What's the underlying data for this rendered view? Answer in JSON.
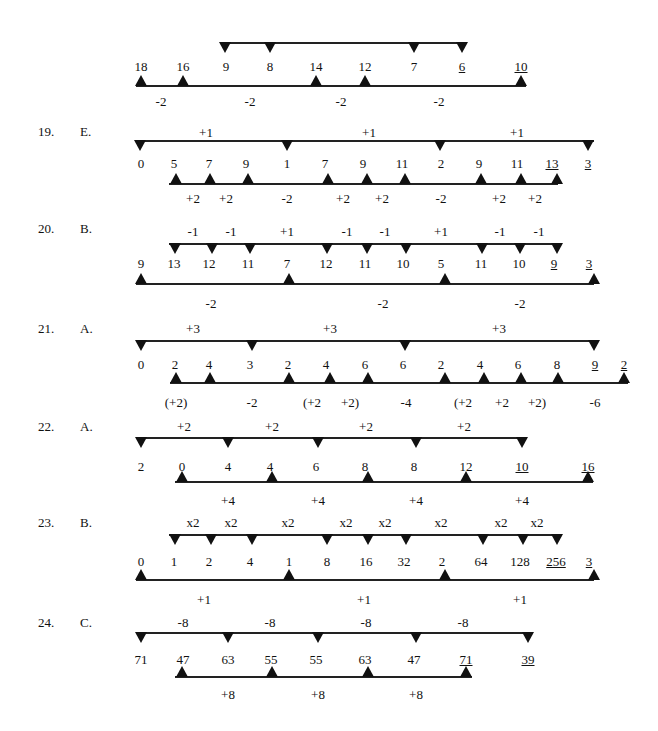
{
  "problems": [
    {
      "id": "18-cont",
      "number": "",
      "answer": "",
      "numY": 60,
      "numbers": [
        {
          "v": "18",
          "x": 141
        },
        {
          "v": "16",
          "x": 183
        },
        {
          "v": "9",
          "x": 226
        },
        {
          "v": "8",
          "x": 270
        },
        {
          "v": "14",
          "x": 316
        },
        {
          "v": "12",
          "x": 365
        },
        {
          "v": "7",
          "x": 414
        },
        {
          "v": "6",
          "x": 462,
          "u": true
        },
        {
          "v": "10",
          "x": 521,
          "u": true
        }
      ],
      "top": {
        "lineY": 42,
        "x1": 225,
        "x2": 463,
        "markers": [
          225,
          270,
          414,
          462
        ],
        "labels": []
      },
      "bottom": {
        "lineY": 85,
        "x1": 136,
        "x2": 526,
        "markers": [
          141,
          183,
          316,
          365,
          521
        ],
        "labels": [
          {
            "v": "-2",
            "x": 161
          },
          {
            "v": "-2",
            "x": 250
          },
          {
            "v": "-2",
            "x": 341
          },
          {
            "v": "-2",
            "x": 439
          }
        ],
        "labelY": 95
      }
    },
    {
      "id": "19",
      "number": "19.",
      "answer": "E.",
      "headY": 125,
      "numY": 157,
      "numbers": [
        {
          "v": "0",
          "x": 141
        },
        {
          "v": "5",
          "x": 174
        },
        {
          "v": "7",
          "x": 209
        },
        {
          "v": "9",
          "x": 246
        },
        {
          "v": "1",
          "x": 287
        },
        {
          "v": "7",
          "x": 325
        },
        {
          "v": "9",
          "x": 363
        },
        {
          "v": "11",
          "x": 402
        },
        {
          "v": "2",
          "x": 441
        },
        {
          "v": "9",
          "x": 479
        },
        {
          "v": "11",
          "x": 517
        },
        {
          "v": "13",
          "x": 552,
          "u": true
        },
        {
          "v": "3",
          "x": 588,
          "u": true
        }
      ],
      "top": {
        "lineY": 140,
        "x1": 136,
        "x2": 594,
        "markers": [
          140,
          287,
          440,
          588
        ],
        "labels": [
          {
            "v": "+1",
            "x": 206
          },
          {
            "v": "+1",
            "x": 369
          },
          {
            "v": "+1",
            "x": 517
          }
        ],
        "labelY": 126
      },
      "bottom": {
        "lineY": 183,
        "x1": 169,
        "x2": 558,
        "markers": [
          176,
          210,
          248,
          328,
          367,
          405,
          481,
          521,
          557
        ],
        "labels": [
          {
            "v": "+2",
            "x": 193
          },
          {
            "v": "+2",
            "x": 226
          },
          {
            "v": "-2",
            "x": 287
          },
          {
            "v": "+2",
            "x": 343
          },
          {
            "v": "+2",
            "x": 382
          },
          {
            "v": "-2",
            "x": 441
          },
          {
            "v": "+2",
            "x": 499
          },
          {
            "v": "+2",
            "x": 535
          }
        ],
        "labelY": 192
      }
    },
    {
      "id": "20",
      "number": "20.",
      "answer": "B.",
      "headY": 222,
      "numY": 257,
      "numbers": [
        {
          "v": "9",
          "x": 141
        },
        {
          "v": "13",
          "x": 174
        },
        {
          "v": "12",
          "x": 209
        },
        {
          "v": "11",
          "x": 248
        },
        {
          "v": "7",
          "x": 287
        },
        {
          "v": "12",
          "x": 326
        },
        {
          "v": "11",
          "x": 365
        },
        {
          "v": "10",
          "x": 403
        },
        {
          "v": "5",
          "x": 441
        },
        {
          "v": "11",
          "x": 481
        },
        {
          "v": "10",
          "x": 519
        },
        {
          "v": "9",
          "x": 554,
          "u": true
        },
        {
          "v": "3",
          "x": 589,
          "u": true
        }
      ],
      "top": {
        "lineY": 243,
        "x1": 169,
        "x2": 559,
        "markers": [
          175,
          212,
          250,
          327,
          367,
          406,
          482,
          520,
          557
        ],
        "labels": [
          {
            "v": "-1",
            "x": 193
          },
          {
            "v": "-1",
            "x": 231
          },
          {
            "v": "+1",
            "x": 287
          },
          {
            "v": "-1",
            "x": 347
          },
          {
            "v": "-1",
            "x": 385
          },
          {
            "v": "+1",
            "x": 441
          },
          {
            "v": "-1",
            "x": 500
          },
          {
            "v": "-1",
            "x": 539
          }
        ],
        "labelY": 225
      },
      "bottom": {
        "lineY": 283,
        "x1": 136,
        "x2": 594,
        "markers": [
          141,
          289,
          445,
          594
        ],
        "labels": [
          {
            "v": "-2",
            "x": 211
          },
          {
            "v": "-2",
            "x": 383
          },
          {
            "v": "-2",
            "x": 520
          }
        ],
        "labelY": 297
      }
    },
    {
      "id": "21",
      "number": "21.",
      "answer": "A.",
      "headY": 322,
      "numY": 358,
      "numbers": [
        {
          "v": "0",
          "x": 141
        },
        {
          "v": "2",
          "x": 175
        },
        {
          "v": "4",
          "x": 209
        },
        {
          "v": "3",
          "x": 250
        },
        {
          "v": "2",
          "x": 288
        },
        {
          "v": "4",
          "x": 326
        },
        {
          "v": "6",
          "x": 365
        },
        {
          "v": "6",
          "x": 403
        },
        {
          "v": "2",
          "x": 441
        },
        {
          "v": "4",
          "x": 480
        },
        {
          "v": "6",
          "x": 518
        },
        {
          "v": "8",
          "x": 557
        },
        {
          "v": "9",
          "x": 595,
          "u": true
        },
        {
          "v": "2",
          "x": 624,
          "u": true
        }
      ],
      "top": {
        "lineY": 340,
        "x1": 136,
        "x2": 594,
        "markers": [
          141,
          252,
          405,
          594
        ],
        "labels": [
          {
            "v": "+3",
            "x": 193
          },
          {
            "v": "+3",
            "x": 330
          },
          {
            "v": "+3",
            "x": 499
          }
        ],
        "labelY": 322
      },
      "bottom": {
        "lineY": 382,
        "x1": 170,
        "x2": 628,
        "markers": [
          176,
          210,
          289,
          330,
          368,
          445,
          484,
          521,
          558,
          624
        ],
        "labels": [
          {
            "v": "(+2)",
            "x": 176
          },
          {
            "v": "-2",
            "x": 252
          },
          {
            "v": "(+2",
            "x": 312
          },
          {
            "v": "+2)",
            "x": 350
          },
          {
            "v": "-4",
            "x": 406
          },
          {
            "v": "(+2",
            "x": 463
          },
          {
            "v": "+2",
            "x": 502
          },
          {
            "v": "+2)",
            "x": 537
          },
          {
            "v": "-6",
            "x": 595
          }
        ],
        "labelY": 396
      }
    },
    {
      "id": "22",
      "number": "22.",
      "answer": "A.",
      "headY": 420,
      "numY": 460,
      "numbers": [
        {
          "v": "2",
          "x": 141
        },
        {
          "v": "0",
          "x": 182
        },
        {
          "v": "4",
          "x": 228
        },
        {
          "v": "4",
          "x": 270
        },
        {
          "v": "6",
          "x": 316
        },
        {
          "v": "8",
          "x": 365
        },
        {
          "v": "8",
          "x": 414
        },
        {
          "v": "12",
          "x": 466
        },
        {
          "v": "10",
          "x": 522,
          "u": true
        },
        {
          "v": "16",
          "x": 588,
          "u": true
        }
      ],
      "top": {
        "lineY": 437,
        "x1": 136,
        "x2": 527,
        "markers": [
          141,
          228,
          318,
          416,
          522
        ],
        "labels": [
          {
            "v": "+2",
            "x": 184
          },
          {
            "v": "+2",
            "x": 272
          },
          {
            "v": "+2",
            "x": 366
          },
          {
            "v": "+2",
            "x": 464
          }
        ],
        "labelY": 420
      },
      "bottom": {
        "lineY": 481,
        "x1": 175,
        "x2": 593,
        "markers": [
          182,
          272,
          368,
          466,
          588
        ],
        "labels": [
          {
            "v": "+4",
            "x": 228
          },
          {
            "v": "+4",
            "x": 318
          },
          {
            "v": "+4",
            "x": 416
          },
          {
            "v": "+4",
            "x": 522
          }
        ],
        "labelY": 494
      }
    },
    {
      "id": "23",
      "number": "23.",
      "answer": "B.",
      "headY": 516,
      "numY": 555,
      "numbers": [
        {
          "v": "0",
          "x": 141
        },
        {
          "v": "1",
          "x": 174
        },
        {
          "v": "2",
          "x": 209
        },
        {
          "v": "4",
          "x": 250
        },
        {
          "v": "1",
          "x": 289
        },
        {
          "v": "8",
          "x": 327
        },
        {
          "v": "16",
          "x": 366
        },
        {
          "v": "32",
          "x": 404
        },
        {
          "v": "2",
          "x": 442
        },
        {
          "v": "64",
          "x": 481
        },
        {
          "v": "128",
          "x": 520
        },
        {
          "v": "256",
          "x": 556,
          "u": true
        },
        {
          "v": "3",
          "x": 589,
          "u": true
        }
      ],
      "top": {
        "lineY": 534,
        "x1": 169,
        "x2": 561,
        "markers": [
          175,
          211,
          252,
          327,
          368,
          406,
          483,
          523,
          557
        ],
        "labels": [
          {
            "v": "x2",
            "x": 193
          },
          {
            "v": "x2",
            "x": 231
          },
          {
            "v": "x2",
            "x": 288
          },
          {
            "v": "x2",
            "x": 346
          },
          {
            "v": "x2",
            "x": 385
          },
          {
            "v": "x2",
            "x": 441
          },
          {
            "v": "x2",
            "x": 501
          },
          {
            "v": "x2",
            "x": 537
          }
        ],
        "labelY": 516
      },
      "bottom": {
        "lineY": 579,
        "x1": 136,
        "x2": 594,
        "markers": [
          141,
          289,
          445,
          594
        ],
        "labels": [
          {
            "v": "+1",
            "x": 204
          },
          {
            "v": "+1",
            "x": 364
          },
          {
            "v": "+1",
            "x": 520
          }
        ],
        "labelY": 593
      }
    },
    {
      "id": "24",
      "number": "24.",
      "answer": "C.",
      "headY": 616,
      "numY": 653,
      "numbers": [
        {
          "v": "71",
          "x": 141
        },
        {
          "v": "47",
          "x": 183
        },
        {
          "v": "63",
          "x": 228
        },
        {
          "v": "55",
          "x": 271
        },
        {
          "v": "55",
          "x": 316
        },
        {
          "v": "63",
          "x": 365
        },
        {
          "v": "47",
          "x": 414
        },
        {
          "v": "71",
          "x": 466,
          "u": true
        },
        {
          "v": "39",
          "x": 528,
          "u": true
        }
      ],
      "top": {
        "lineY": 632,
        "x1": 136,
        "x2": 532,
        "markers": [
          141,
          228,
          318,
          416,
          528
        ],
        "labels": [
          {
            "v": "-8",
            "x": 183
          },
          {
            "v": "-8",
            "x": 270
          },
          {
            "v": "-8",
            "x": 366
          },
          {
            "v": "-8",
            "x": 463
          }
        ],
        "labelY": 616
      },
      "bottom": {
        "lineY": 676,
        "x1": 175,
        "x2": 472,
        "markers": [
          182,
          272,
          368,
          466
        ],
        "labels": [
          {
            "v": "+8",
            "x": 228
          },
          {
            "v": "+8",
            "x": 318
          },
          {
            "v": "+8",
            "x": 416
          }
        ],
        "labelY": 688
      }
    }
  ],
  "layout": {
    "numberX": 38,
    "answerX": 80,
    "markerColor": "#111111",
    "lineColor": "#222222"
  }
}
